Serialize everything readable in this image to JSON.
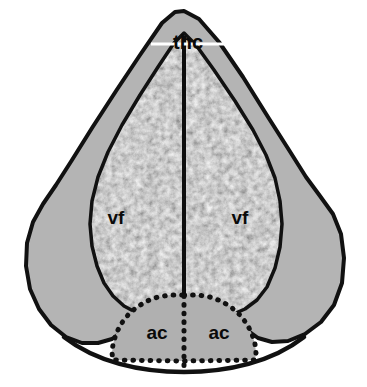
{
  "figure": {
    "kind": "anatomical-cross-section",
    "background_color": "#ffffff",
    "width": 367,
    "height": 387
  },
  "colors": {
    "background": "#ffffff",
    "outer_fill": "#b4b4b4",
    "commissure_fill": "#b0b0b0",
    "outline": "#111111",
    "midline": "#0d0d0d",
    "leader_line": "#ffffff",
    "texture_light": "#e9e9e9",
    "texture_mid": "#bdbdbd",
    "texture_dark": "#6e6e6e"
  },
  "labels": {
    "apex": {
      "text": "thc",
      "name": "label-thc",
      "x": 188,
      "y": 44
    },
    "funiculus": [
      {
        "text": "vf",
        "name": "label-vf-left",
        "x": 116,
        "y": 219
      },
      {
        "text": "vf",
        "name": "label-vf-right",
        "x": 240,
        "y": 219
      }
    ],
    "commissure": [
      {
        "text": "ac",
        "name": "label-ac-left",
        "x": 157,
        "y": 334
      },
      {
        "text": "ac",
        "name": "label-ac-right",
        "x": 219,
        "y": 334
      }
    ]
  },
  "geometry": {
    "outer_outline": "M 184 11 L 199 19 L 219 42 L 243 77 L 268 117 L 289 150 L 306 177 L 320 196 L 333 214 L 341 234 L 344 258 L 342 283 L 334 305 L 321 322 L 305 334 L 288 341 L 272 342 L 258 338 L 247 330 L 240 320 L 236 310 L 232 301 L 225 295 L 216 292 L 205 291 L 196 291 L 186 291 L 176 291 L 164 292 L 153 295 L 144 301 L 137 310 L 131 321 L 123 331 L 112 339 L 98 343 L 82 343 L 66 337 L 51 325 L 39 309 L 30 289 L 26 266 L 27 243 L 33 222 L 43 204 L 56 185 L 72 160 L 92 128 L 116 91 L 140 55 L 162 23 L 175 12 Z",
    "inner_outline": "M 184 33 L 196 45 L 214 70 L 235 101 L 253 130 L 266 155 L 275 178 L 280 201 L 282 224 L 280 247 L 275 268 L 267 287 L 257 300 L 245 309 L 231 315 L 216 318 L 200 319 L 184 319 L 168 319 L 152 317 L 137 313 L 124 306 L 113 296 L 104 283 L 97 266 L 92 246 L 90 224 L 92 201 L 98 177 L 108 152 L 122 125 L 140 95 L 158 67 L 174 43 Z",
    "wing_left": "M 93 247 L 79 253 L 66 263 L 56 276 L 50 291 L 49 306 L 53 318 L 62 328 L 74 334 L 87 335 L 99 331 L 108 323 L 114 313 L 118 301 L 119 289 L 117 276 L 112 264 L 104 254 Z",
    "wing_right": "M 274 247 L 288 253 L 301 263 L 311 276 L 317 291 L 318 306 L 314 318 L 305 328 L 293 334 L 280 335 L 268 331 L 259 323 L 253 313 L 249 301 L 248 289 L 250 276 L 255 264 L 263 254 Z",
    "commissure_dome": "M 184 295 L 198 295 L 210 297 L 221 301 L 231 307 L 240 315 L 247 324 L 252 334 L 255 344 L 256 353 L 255 360 L 184 361 L 113 360 L 112 353 L 113 344 L 116 334 L 121 324 L 128 315 L 137 307 L 147 301 L 158 297 L 170 295 Z",
    "bottom_curve": "M 64 337 C 96 362, 140 372, 184 372 C 228 372, 272 362, 304 337",
    "midline": {
      "x": 184,
      "y_top": 36,
      "y_bottom": 296,
      "width": 4
    },
    "commissure_midline": {
      "x": 184,
      "y_top": 296,
      "y_bottom": 366
    },
    "leader_line": {
      "x1": 151,
      "x2": 230,
      "y": 44
    }
  },
  "legend": {
    "thc": "thc",
    "vf": "vf",
    "ac": "ac"
  }
}
